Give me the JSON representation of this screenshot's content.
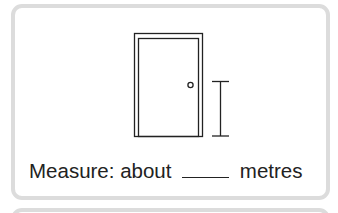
{
  "question": {
    "prefix": "Measure: about",
    "blank": "",
    "unit": "metres"
  },
  "figure": {
    "object_icon": "door-icon",
    "measure_icon": "height-measure-bar-icon"
  },
  "colors": {
    "card_border": "#dcdcdc",
    "ink": "#222222"
  }
}
